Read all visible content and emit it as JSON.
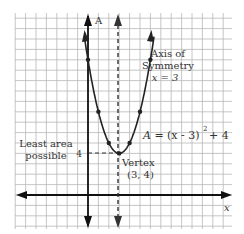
{
  "chart_data": {
    "type": "line",
    "title": "",
    "equation": "A = (x - 3)² + 4",
    "xlabel": "x",
    "ylabel": "A",
    "grid": true,
    "vertex": {
      "x": 3,
      "y": 4
    },
    "axis_of_symmetry": 3,
    "points": [
      {
        "x": 0,
        "y": 13
      },
      {
        "x": 1,
        "y": 8
      },
      {
        "x": 2,
        "y": 5
      },
      {
        "x": 3,
        "y": 4
      },
      {
        "x": 4,
        "y": 5
      },
      {
        "x": 5,
        "y": 8
      },
      {
        "x": 6,
        "y": 13
      }
    ],
    "annotations": [
      {
        "text": "Axis of",
        "target": "axis_of_symmetry"
      },
      {
        "text": "Symmetry",
        "target": "axis_of_symmetry"
      },
      {
        "text": "x = 3",
        "target": "axis_of_symmetry"
      },
      {
        "text": "Least area",
        "target": "vertex"
      },
      {
        "text": "possible",
        "target": "vertex"
      },
      {
        "text": "Vertex",
        "target": "vertex"
      },
      {
        "text": "(3, 4)",
        "target": "vertex"
      }
    ],
    "tick_labels": {
      "y": [
        "4"
      ]
    }
  },
  "labels": {
    "y_axis": "A",
    "x_axis": "x",
    "axis_title_1": "Axis of",
    "axis_title_2": "Symmetry",
    "axis_eq": "x = 3",
    "least_1": "Least area",
    "least_2": "possible",
    "y_tick_4": "4",
    "equation_a": "A =",
    "equation_b": "(x - 3)",
    "equation_exp": "2",
    "equation_c": "+ 4",
    "vertex_1": "Vertex",
    "vertex_2": "(3, 4)"
  }
}
